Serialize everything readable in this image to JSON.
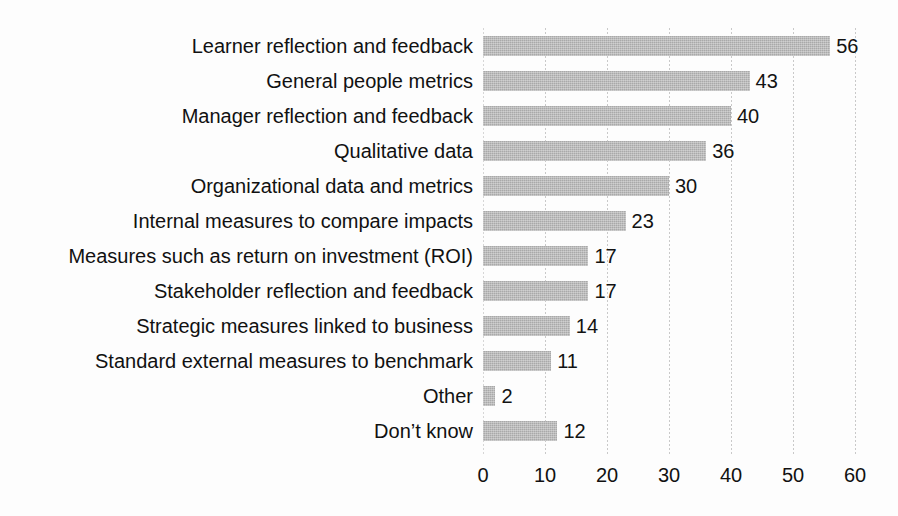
{
  "chart_data": {
    "type": "bar",
    "orientation": "horizontal",
    "title": "",
    "subtitle": "",
    "xlabel": "",
    "ylabel": "",
    "xlim": [
      0,
      60
    ],
    "xticks": [
      0,
      10,
      20,
      30,
      40,
      50,
      60
    ],
    "xtick_labels": [
      "0",
      "10",
      "20",
      "30",
      "40",
      "50",
      "60"
    ],
    "grid": "vertical-dotted",
    "legend": "none",
    "categories": [
      "Learner reflection and feedback",
      "General people metrics",
      "Manager reflection and feedback",
      "Qualitative data",
      "Organizational data and metrics",
      "Internal measures to compare impacts",
      "Measures such as return on investment (ROI)",
      "Stakeholder reflection and feedback",
      "Strategic measures linked to business",
      "Standard external measures to benchmark",
      "Other",
      "Don’t know"
    ],
    "values": [
      56,
      43,
      40,
      36,
      30,
      23,
      17,
      17,
      14,
      11,
      2,
      12
    ],
    "data_labels": [
      "56",
      "43",
      "40",
      "36",
      "30",
      "23",
      "17",
      "17",
      "14",
      "11",
      "2",
      "12"
    ],
    "series": [
      {
        "name": "",
        "values": [
          56,
          43,
          40,
          36,
          30,
          23,
          17,
          17,
          14,
          11,
          2,
          12
        ]
      }
    ],
    "colors": {
      "bar": "#a9a9a9",
      "background": "#fdfdfd",
      "text": "#111111",
      "gridline": "#c9c9c9"
    }
  }
}
